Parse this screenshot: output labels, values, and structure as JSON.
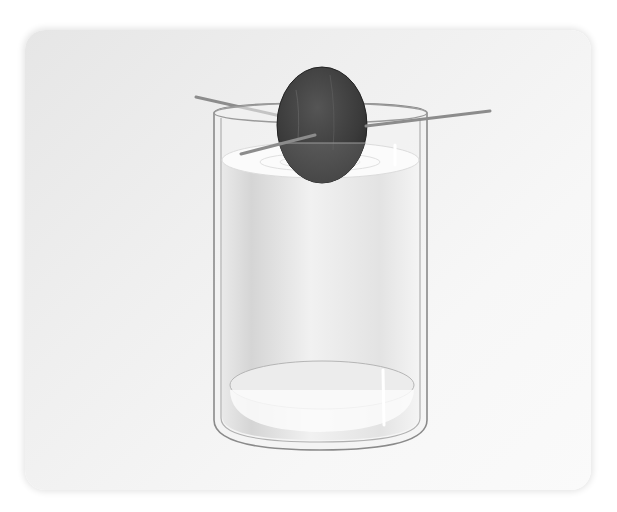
{
  "image": {
    "description": "Illustration of an avocado seed suspended by three toothpicks over a glass of water",
    "subject": "avocado-seed-in-water-glass",
    "elements": [
      "rounded-card-background",
      "drinking-glass",
      "water",
      "avocado-seed",
      "toothpicks"
    ],
    "toothpick_count": 3,
    "colors": {
      "background": "#ffffff",
      "card": "#eeeeee",
      "seed": "#3d3d3d",
      "seed_submerged": "#595959",
      "water": "#e4e4e4",
      "glass_outline": "#8a8a8a",
      "toothpick": "#8c8c8c"
    }
  }
}
